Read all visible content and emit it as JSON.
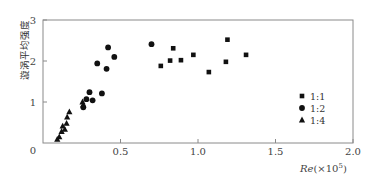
{
  "chart_data": {
    "type": "scatter",
    "title": "",
    "xlabel": "Re(×10⁵)",
    "xlabel_main": "Re",
    "xlabel_suffix": "(×10",
    "xlabel_exp": "5",
    "xlabel_close": ")",
    "ylabel": "漩涡平均强度",
    "xlim": [
      0,
      2.0
    ],
    "ylim": [
      0,
      3
    ],
    "xticks": [
      0,
      0.5,
      1.0,
      1.5,
      2.0
    ],
    "xtick_labels": [
      "0",
      "0.5",
      "1.0",
      "1.5",
      "2.0"
    ],
    "yticks": [
      1,
      2,
      3
    ],
    "ytick_labels": [
      "1",
      "2",
      "3"
    ],
    "grid": false,
    "legend_position": "lower right inside",
    "series": [
      {
        "name": "1:1",
        "marker": "square",
        "color": "#111111",
        "points": [
          [
            0.76,
            1.88
          ],
          [
            0.82,
            2.01
          ],
          [
            0.84,
            2.31
          ],
          [
            0.89,
            2.02
          ],
          [
            0.97,
            2.15
          ],
          [
            1.07,
            1.73
          ],
          [
            1.18,
            1.98
          ],
          [
            1.19,
            2.52
          ],
          [
            1.31,
            2.15
          ]
        ]
      },
      {
        "name": "1:2",
        "marker": "circle",
        "color": "#111111",
        "points": [
          [
            0.7,
            2.41
          ],
          [
            0.42,
            2.33
          ],
          [
            0.46,
            2.1
          ],
          [
            0.35,
            1.94
          ],
          [
            0.41,
            1.81
          ],
          [
            0.3,
            1.24
          ],
          [
            0.38,
            1.21
          ],
          [
            0.28,
            1.07
          ],
          [
            0.32,
            1.04
          ],
          [
            0.26,
            0.87
          ]
        ]
      },
      {
        "name": "1:4",
        "marker": "triangle",
        "color": "#111111",
        "points": [
          [
            0.255,
            1.0
          ],
          [
            0.26,
            0.93
          ],
          [
            0.17,
            0.76
          ],
          [
            0.156,
            0.63
          ],
          [
            0.152,
            0.48
          ],
          [
            0.127,
            0.41
          ],
          [
            0.141,
            0.33
          ],
          [
            0.12,
            0.28
          ],
          [
            0.105,
            0.15
          ],
          [
            0.092,
            0.09
          ]
        ]
      }
    ]
  },
  "layout": {
    "plot_left": 43,
    "plot_top": 20,
    "plot_right": 353,
    "plot_bottom": 143,
    "frame_color": "#8a8a8a"
  }
}
